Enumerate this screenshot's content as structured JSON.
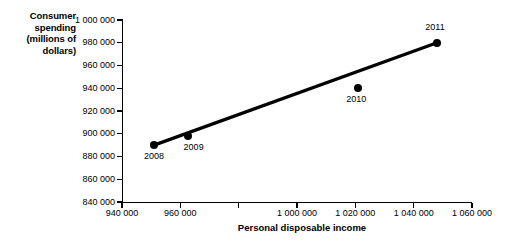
{
  "chart_data": {
    "type": "scatter",
    "title": "",
    "xlabel": "Personal disposable income",
    "ylabel": "Consumer spending (millions of dollars)",
    "ylabel_lines": [
      "Consumer",
      "spending",
      "(millions of",
      "dollars)"
    ],
    "xlim": [
      940000,
      1060000
    ],
    "ylim": [
      840000,
      1000000
    ],
    "grid": false,
    "legend": null,
    "x_ticks": [
      {
        "value": 940000,
        "label": "940 000"
      },
      {
        "value": 960000,
        "label": "960 000"
      },
      {
        "value": 980000,
        "label": ""
      },
      {
        "value": 1000000,
        "label": "1 000 000"
      },
      {
        "value": 1020000,
        "label": "1 020 000"
      },
      {
        "value": 1040000,
        "label": "1 040 000"
      },
      {
        "value": 1060000,
        "label": "1 060 000"
      }
    ],
    "y_ticks": [
      {
        "value": 840000,
        "label": "840 000"
      },
      {
        "value": 860000,
        "label": "860 000"
      },
      {
        "value": 880000,
        "label": "880 000"
      },
      {
        "value": 900000,
        "label": "900 000"
      },
      {
        "value": 920000,
        "label": "920 000"
      },
      {
        "value": 940000,
        "label": "940 000"
      },
      {
        "value": 960000,
        "label": "960 000"
      },
      {
        "value": 980000,
        "label": "980 000"
      },
      {
        "value": 1000000,
        "label": "1 000 000"
      }
    ],
    "points": [
      {
        "label": "2008",
        "x": 951000,
        "y": 890000,
        "label_dx": 0,
        "label_dy": 11
      },
      {
        "label": "2009",
        "x": 962500,
        "y": 898000,
        "label_dx": 6,
        "label_dy": 11
      },
      {
        "label": "2010",
        "x": 1021000,
        "y": 940000,
        "label_dx": -2,
        "label_dy": 11
      },
      {
        "label": "2011",
        "x": 1048000,
        "y": 980000,
        "label_dx": -2,
        "label_dy": -16
      }
    ],
    "trend_line": {
      "from": {
        "x": 951000,
        "y": 890000
      },
      "to": {
        "x": 1048000,
        "y": 980000
      },
      "color": "#000000",
      "width": 3.2
    },
    "colors": {
      "point": "#000000",
      "axis": "#000000",
      "background": "#ffffff",
      "text": "#000000"
    }
  }
}
